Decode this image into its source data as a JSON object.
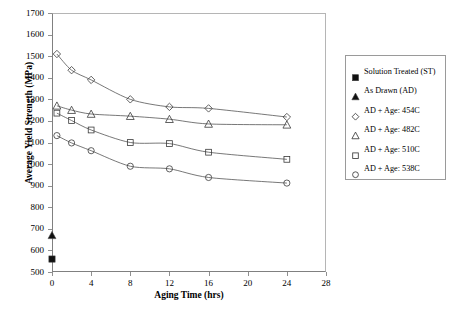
{
  "chart_data": {
    "type": "scatter",
    "title": "",
    "xlabel": "Aging Time (hrs)",
    "ylabel": "Average Yield Strength (MPa)",
    "xlim": [
      0,
      28
    ],
    "ylim": [
      500,
      1700
    ],
    "xticks": [
      0,
      4,
      8,
      12,
      16,
      20,
      24,
      28
    ],
    "yticks": [
      500,
      600,
      700,
      800,
      900,
      1000,
      1100,
      1200,
      1300,
      1400,
      1500,
      1600,
      1700
    ],
    "grid": false,
    "legend_position": "right",
    "series": [
      {
        "name": "Solution Treated (ST)",
        "marker": "filled-square",
        "x": [
          0
        ],
        "values": [
          560
        ],
        "trendline": false
      },
      {
        "name": "As Drawn (AD)",
        "marker": "filled-triangle",
        "x": [
          0
        ],
        "values": [
          670
        ],
        "trendline": false
      },
      {
        "name": "AD + Age: 454C",
        "marker": "open-diamond",
        "x": [
          0.5,
          2,
          4,
          8,
          12,
          16,
          24
        ],
        "values": [
          1510,
          1435,
          1390,
          1300,
          1265,
          1258,
          1218
        ],
        "trendline": true
      },
      {
        "name": "AD + Age: 482C",
        "marker": "open-triangle",
        "x": [
          0.5,
          2,
          4,
          8,
          12,
          16,
          24
        ],
        "values": [
          1270,
          1250,
          1232,
          1222,
          1208,
          1186,
          1182
        ],
        "trendline": true
      },
      {
        "name": "AD + Age: 510C",
        "marker": "open-square",
        "x": [
          0.5,
          2,
          4,
          8,
          12,
          16,
          24
        ],
        "values": [
          1236,
          1202,
          1158,
          1100,
          1095,
          1055,
          1022
        ],
        "trendline": true
      },
      {
        "name": "AD + Age: 538C",
        "marker": "open-circle",
        "x": [
          0.5,
          2,
          4,
          8,
          12,
          16,
          24
        ],
        "values": [
          1132,
          1098,
          1062,
          990,
          978,
          938,
          912
        ],
        "trendline": true
      }
    ]
  },
  "legend": {
    "items": [
      {
        "label": "Solution Treated (ST)",
        "marker": "filled-square"
      },
      {
        "label": "As Drawn (AD)",
        "marker": "filled-triangle"
      },
      {
        "label": "AD + Age: 454C",
        "marker": "open-diamond"
      },
      {
        "label": "AD + Age: 482C",
        "marker": "open-triangle"
      },
      {
        "label": "AD + Age: 510C",
        "marker": "open-square"
      },
      {
        "label": "AD + Age: 538C",
        "marker": "open-circle"
      }
    ]
  },
  "colors": {
    "marker": "#3a3a3a",
    "line": "#555555",
    "axis": "#808080",
    "frame_light": "#b5b5b5",
    "text": "#000000"
  }
}
